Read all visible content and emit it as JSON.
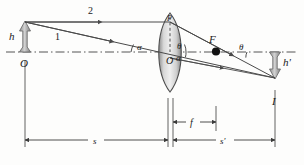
{
  "figure": {
    "kind": "optics-ray-diagram",
    "width": 304,
    "height": 165,
    "background_color": "#fdfdfc"
  },
  "colors": {
    "line": "#4a4a4a",
    "axis": "#555555",
    "arrow_fill": "#b5b5b5",
    "arrow_stroke": "#6e6e6e",
    "lens_fill": "#c9c9c9",
    "lens_stroke": "#4d4d4d",
    "focal_dot": "#111111",
    "text": "#1a1a1a",
    "dimension": "#3a3a3a"
  },
  "labels": {
    "object_height": "h",
    "image_height": "h'",
    "vertex_origin": "O",
    "lens_center": "O",
    "lens_top_point": "P",
    "focal_point": "F",
    "image_point": "I",
    "ray_one": "1",
    "ray_two": "2",
    "angle_alpha_left": "α",
    "angle_alpha_right": "α",
    "angle_theta_left": "θ",
    "angle_theta_right": "θ",
    "object_distance": "s",
    "focal_length": "f",
    "image_distance": "s'"
  },
  "geometry": {
    "axis_y": 52,
    "object_x": 25,
    "object_tip_y": 22,
    "lens_center_x": 170,
    "lens_top_y": 14,
    "lens_bottom_y": 92,
    "focal_x": 216,
    "image_x": 275,
    "image_tip_y": 78
  },
  "dimensions": [
    {
      "name": "object-distance",
      "label": "s",
      "from_x": 25,
      "to_x": 168,
      "y": 140
    },
    {
      "name": "focal-length",
      "label": "f",
      "from_x": 173,
      "to_x": 216,
      "y": 122
    },
    {
      "name": "image-distance",
      "label": "s'",
      "from_x": 173,
      "to_x": 275,
      "y": 140
    }
  ]
}
